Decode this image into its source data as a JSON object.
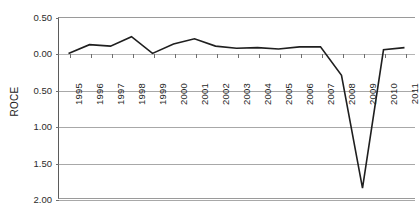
{
  "chart_data": {
    "type": "line",
    "title": "",
    "xlabel": "",
    "ylabel": "ROCE",
    "x": [
      1995,
      1996,
      1997,
      1998,
      1999,
      2000,
      2001,
      2002,
      2003,
      2004,
      2005,
      2006,
      2007,
      2008,
      2009,
      2010,
      2011
    ],
    "categories": [
      "1995",
      "1996",
      "1997",
      "1998",
      "1999",
      "2000",
      "2001",
      "2002",
      "2003",
      "2004",
      "2005",
      "2006",
      "2007",
      "2008",
      "2009",
      "2010",
      "2011"
    ],
    "series": [
      {
        "name": "ROCE",
        "values": [
          0.0,
          0.12,
          0.1,
          0.23,
          0.0,
          0.13,
          0.2,
          0.1,
          0.07,
          0.08,
          0.06,
          0.09,
          0.09,
          -0.3,
          -1.85,
          0.05,
          0.08
        ]
      }
    ],
    "ylim": [
      0.5,
      -2.0
    ],
    "y_inverted": true,
    "ytick_values": [
      0.5,
      0.0,
      -0.5,
      -1.0,
      -1.5,
      -2.0
    ],
    "ytick_labels": [
      "0.50",
      "0.00",
      "0.50",
      "1.00",
      "1.50",
      "2.00"
    ],
    "grid": true,
    "grid_axis": "y",
    "legend": false,
    "legend_position": "none",
    "line_color": "#1f1f1f",
    "axis_color": "#5b5b5b",
    "grid_color": "#a8a8a8",
    "background": "#ffffff"
  },
  "axes": {
    "y_title": "ROCE"
  }
}
